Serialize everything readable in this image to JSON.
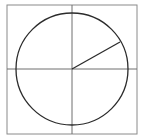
{
  "diagram": {
    "type": "unit-circle-with-radius",
    "frame": {
      "x": 7,
      "y": 5,
      "width": 130,
      "height": 129,
      "stroke": "#8a8a8a"
    },
    "axes": {
      "horizontal": {
        "x1": 7,
        "y1": 69,
        "x2": 137,
        "y2": 69
      },
      "vertical": {
        "x1": 72,
        "y1": 5,
        "x2": 72,
        "y2": 134
      },
      "stroke": "#6f6f6f"
    },
    "circle": {
      "cx": 72,
      "cy": 69,
      "r": 56,
      "stroke": "#2b2b2b"
    },
    "radius_line": {
      "x1": 72,
      "y1": 69,
      "x2": 120,
      "y2": 42,
      "angle_deg": 29,
      "stroke": "#2b2b2b"
    }
  }
}
